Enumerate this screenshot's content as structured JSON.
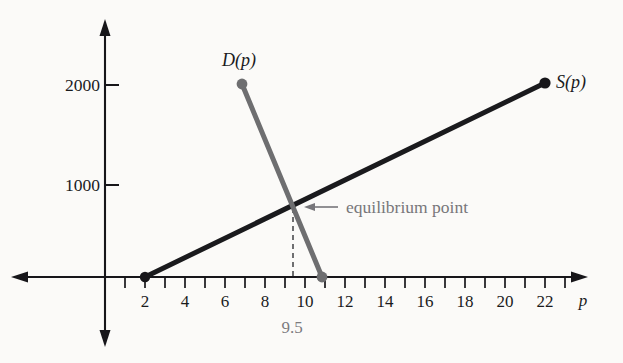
{
  "chart_data": {
    "type": "line",
    "title": "",
    "subtitle": "",
    "xlabel": "p",
    "ylabel": "",
    "xlim": [
      0,
      24
    ],
    "ylim": [
      0,
      2400
    ],
    "grid": false,
    "legend_position": "inline-endpoint-labels",
    "x_tick_step": 1,
    "x_labeled_ticks": [
      2,
      4,
      6,
      8,
      10,
      12,
      14,
      16,
      18,
      20,
      22
    ],
    "x_tick_labels": [
      "2",
      "4",
      "6",
      "8",
      "10",
      "12",
      "14",
      "16",
      "18",
      "20",
      "22"
    ],
    "y_ticks": [
      1000,
      2000
    ],
    "y_tick_labels": [
      "1000",
      "2000"
    ],
    "series": [
      {
        "name": "S(p)",
        "label": "S(p)",
        "role": "supply",
        "color": "#1a1a1d",
        "x": [
          2,
          22
        ],
        "values": [
          0,
          2000
        ],
        "endpoint_markers": [
          {
            "x": 2,
            "y": 0
          },
          {
            "x": 22,
            "y": 2000
          }
        ]
      },
      {
        "name": "D(p)",
        "label": "D(p)",
        "role": "demand",
        "color": "#6e6e70",
        "x": [
          7,
          11
        ],
        "values": [
          2000,
          0
        ],
        "endpoint_markers": [
          {
            "x": 7,
            "y": 2000
          },
          {
            "x": 11,
            "y": 0
          }
        ]
      }
    ],
    "annotations": [
      {
        "name": "equilibrium-point",
        "text": "equilibrium point",
        "x": 9.5,
        "y": 750,
        "color": "#77767a",
        "arrow": true
      },
      {
        "name": "equilibrium-price-label",
        "text": "9.5",
        "x": 9.5,
        "y": 0,
        "color": "#7c7b7f",
        "dashed_drop_line": true
      }
    ],
    "equilibrium": {
      "price": 9.5,
      "quantity": 750,
      "price_label": "9.5"
    }
  },
  "labels": {
    "demand_curve": "D(p)",
    "supply_curve": "S(p)",
    "x_axis_variable": "p",
    "equilibrium_annotation": "equilibrium point",
    "equilibrium_price": "9.5",
    "y_tick_2000": "2000",
    "y_tick_1000": "1000"
  },
  "x_axis": {
    "labels": [
      "2",
      "4",
      "6",
      "8",
      "10",
      "12",
      "14",
      "16",
      "18",
      "20",
      "22"
    ],
    "variable": "p"
  },
  "y_axis": {
    "labels": [
      "2000",
      "1000"
    ]
  },
  "colors": {
    "supply": "#1a1a1d",
    "demand": "#6e6e70",
    "annotation": "#77767a",
    "axis": "#17161a",
    "background": "#fbfaf8"
  }
}
